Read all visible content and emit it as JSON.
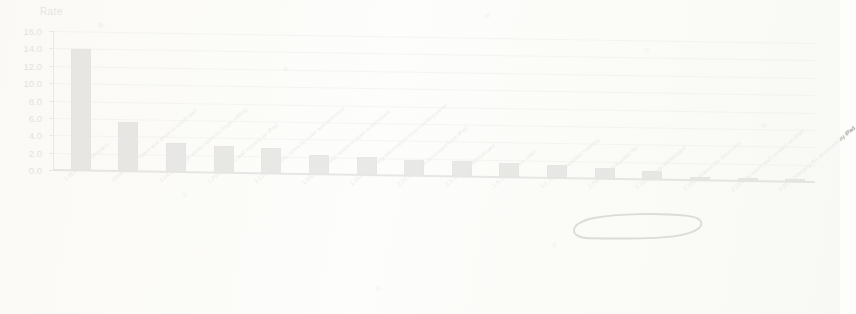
{
  "chart_data": {
    "type": "bar",
    "title": "",
    "ylabel": "Rate",
    "xlabel": "",
    "ylim": [
      0,
      16
    ],
    "yticks": [
      "0.0",
      "2.0",
      "4.0",
      "6.0",
      "8.0",
      "10.0",
      "12.0",
      "14.0",
      "16.0"
    ],
    "grid": true,
    "legend": "none",
    "categories": [
      "1.6Display workspace",
      "Create sticky notes and show to touch wall",
      "3.14.2Do-stack sticky notes by finger sliding",
      "2.2View touch wall content on iPad",
      "3.13Stack sticky notes by color and selection",
      "1.5Access group space to open a document",
      "1.2View meeting information from meeting panel",
      "2.16.1Share a document from iPad",
      "3.9.1Launch Whiteboard",
      "1.8.1Play active chart",
      "3.1 Join a scheduled meeting",
      "2.5View downloaded file",
      "3.12Navigate whiteboard",
      "2.19Unshared the document",
      "2.23View touch wall content on iPad",
      "2.16.2Enlarging the document by iPad"
    ],
    "values": [
      14.0,
      5.7,
      3.3,
      3.0,
      2.9,
      2.2,
      2.1,
      1.8,
      1.7,
      1.6,
      1.5,
      1.2,
      1.0,
      0.3,
      0.3,
      0.3
    ],
    "annotations": [
      {
        "type": "hand-drawn-oval",
        "target_category": "3.12Navigate whiteboard",
        "label": "3.12Navigate whiteboard"
      }
    ]
  },
  "colors": {
    "bar": "#787878",
    "gridline": "#b9b9b9",
    "axis": "#8d8d8d",
    "text": "#7a7a7a",
    "annotation": "#3a3a3a",
    "paper": "#fdfdfb"
  }
}
